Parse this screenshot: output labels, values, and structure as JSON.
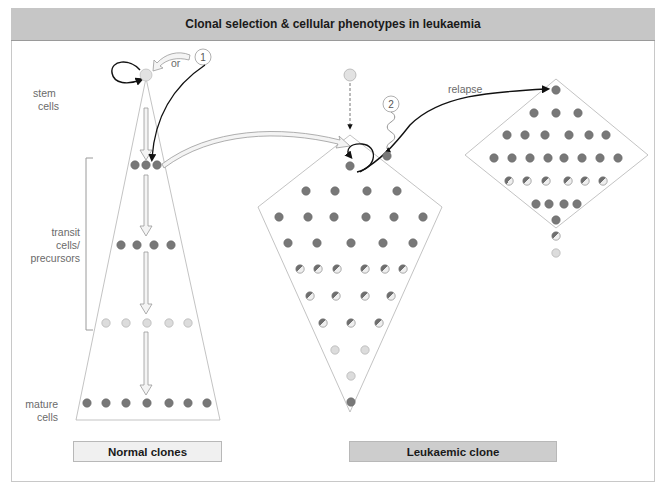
{
  "title": "Clonal selection & cellular phenotypes in leukaemia",
  "labels": {
    "stem_cells": [
      "stem",
      "cells"
    ],
    "transit": [
      "transit",
      "cells/",
      "precursors"
    ],
    "mature": [
      "mature",
      "cells"
    ],
    "or": "or",
    "relapse": "relapse",
    "event1": "1",
    "event2": "2"
  },
  "panels": {
    "normal": "Normal clones",
    "leukaemic": "Leukaemic clone"
  },
  "legend_colors": {
    "dark_cell": "#7a7a7a",
    "light_cell": "#d9d9d9",
    "half_cell": "mixed",
    "outline": "#b4b4b4",
    "frame": "#c6c6c6"
  },
  "cell_types": [
    "stem",
    "dark",
    "light",
    "half"
  ]
}
